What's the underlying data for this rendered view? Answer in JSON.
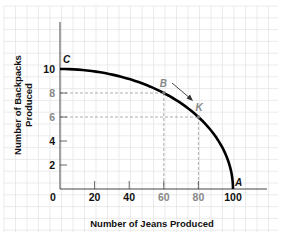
{
  "chart_data": {
    "type": "line",
    "title": "",
    "xlabel": "Number of Jeans Produced",
    "ylabel": "Number of Backpacks Produced",
    "ylabel_lines": [
      "Number of Backpacks",
      "Produced"
    ],
    "xlim": [
      0,
      100
    ],
    "ylim": [
      0,
      10
    ],
    "x_ticks": [
      {
        "value": 0,
        "label": "0",
        "color": "#111111"
      },
      {
        "value": 20,
        "label": "20",
        "color": "#111111"
      },
      {
        "value": 40,
        "label": "40",
        "color": "#111111"
      },
      {
        "value": 60,
        "label": "60",
        "color": "#888888"
      },
      {
        "value": 80,
        "label": "80",
        "color": "#888888"
      },
      {
        "value": 100,
        "label": "100",
        "color": "#111111"
      }
    ],
    "y_ticks": [
      {
        "value": 2,
        "label": "2",
        "color": "#111111"
      },
      {
        "value": 4,
        "label": "4",
        "color": "#111111"
      },
      {
        "value": 6,
        "label": "6",
        "color": "#888888"
      },
      {
        "value": 8,
        "label": "8",
        "color": "#888888"
      },
      {
        "value": 10,
        "label": "10",
        "color": "#111111"
      }
    ],
    "grid": true,
    "series": [
      {
        "name": "Production Possibilities Frontier",
        "x": [
          0,
          20,
          40,
          60,
          80,
          90,
          100
        ],
        "y": [
          10,
          9.8,
          9.2,
          8,
          6,
          4.4,
          0
        ]
      }
    ],
    "points": [
      {
        "label": "C",
        "x": 0,
        "y": 10
      },
      {
        "label": "B",
        "x": 60,
        "y": 8
      },
      {
        "label": "K",
        "x": 80,
        "y": 6
      },
      {
        "label": "A",
        "x": 100,
        "y": 0
      }
    ],
    "annotations": [
      {
        "type": "arrow",
        "from": "B",
        "to": "K"
      },
      {
        "type": "dashed-guide",
        "point": "B"
      },
      {
        "type": "dashed-guide",
        "point": "K"
      }
    ]
  },
  "colors": {
    "curve": "#000000",
    "axis": "#444444",
    "grid": "#e6e6e6",
    "guide": "#9a9a9a",
    "dark_label": "#111111",
    "muted_label": "#888888"
  }
}
